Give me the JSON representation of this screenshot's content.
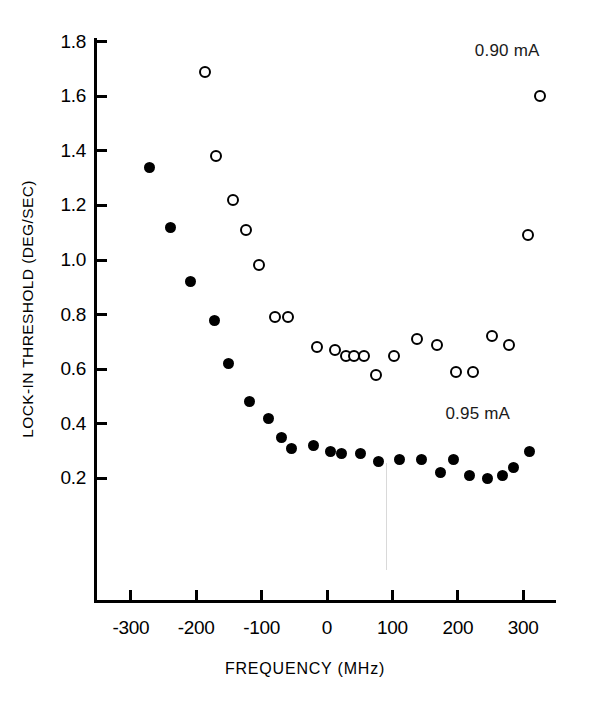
{
  "figure": {
    "background": "#ffffff",
    "ink_color": "#000000"
  },
  "chart_data": {
    "type": "scatter",
    "title": "",
    "xlabel": "FREQUENCY (MHz)",
    "ylabel": "LOCK-IN THRESHOLD (DEG/SEC)",
    "xlim": [
      -350,
      340
    ],
    "ylim": [
      0.0,
      1.85
    ],
    "grid": false,
    "legend_position": "in-plot annotations",
    "xticks": [
      -300,
      -200,
      -100,
      0,
      100,
      200,
      300
    ],
    "xtick_labels": [
      "-300",
      "-200",
      "-100",
      "0",
      "100",
      "200",
      "300"
    ],
    "yticks": [
      0.2,
      0.4,
      0.6,
      0.8,
      1.0,
      1.2,
      1.4,
      1.6,
      1.8
    ],
    "ytick_labels": [
      "0.2",
      "0.4",
      "0.6",
      "0.8",
      "1.0",
      "1.2",
      "1.4",
      "1.6",
      "1.8"
    ],
    "annotations": [
      {
        "text": "0.90 mA",
        "x": 275,
        "y": 1.77
      },
      {
        "text": "0.95 mA",
        "x": 230,
        "y": 0.44
      }
    ],
    "series": [
      {
        "name": "0.90 mA",
        "marker": "open-circle",
        "points": [
          [
            -187,
            1.69
          ],
          [
            -170,
            1.38
          ],
          [
            -144,
            1.22
          ],
          [
            -124,
            1.11
          ],
          [
            -104,
            0.98
          ],
          [
            -79,
            0.79
          ],
          [
            -60,
            0.79
          ],
          [
            -16,
            0.68
          ],
          [
            12,
            0.67
          ],
          [
            29,
            0.65
          ],
          [
            41,
            0.65
          ],
          [
            56,
            0.65
          ],
          [
            75,
            0.58
          ],
          [
            103,
            0.65
          ],
          [
            137,
            0.71
          ],
          [
            168,
            0.69
          ],
          [
            198,
            0.59
          ],
          [
            224,
            0.59
          ],
          [
            252,
            0.72
          ],
          [
            278,
            0.69
          ],
          [
            308,
            1.09
          ],
          [
            325,
            1.6
          ]
        ]
      },
      {
        "name": "0.95 mA",
        "marker": "filled-circle",
        "points": [
          [
            -272,
            1.34
          ],
          [
            -239,
            1.12
          ],
          [
            -209,
            0.92
          ],
          [
            -172,
            0.78
          ],
          [
            -150,
            0.62
          ],
          [
            -118,
            0.48
          ],
          [
            -89,
            0.42
          ],
          [
            -69,
            0.35
          ],
          [
            -55,
            0.31
          ],
          [
            -20,
            0.32
          ],
          [
            6,
            0.3
          ],
          [
            22,
            0.29
          ],
          [
            51,
            0.29
          ],
          [
            78,
            0.26
          ],
          [
            111,
            0.27
          ],
          [
            144,
            0.27
          ],
          [
            174,
            0.22
          ],
          [
            193,
            0.27
          ],
          [
            218,
            0.21
          ],
          [
            246,
            0.2
          ],
          [
            269,
            0.21
          ],
          [
            285,
            0.24
          ],
          [
            309,
            0.3
          ]
        ]
      }
    ]
  }
}
